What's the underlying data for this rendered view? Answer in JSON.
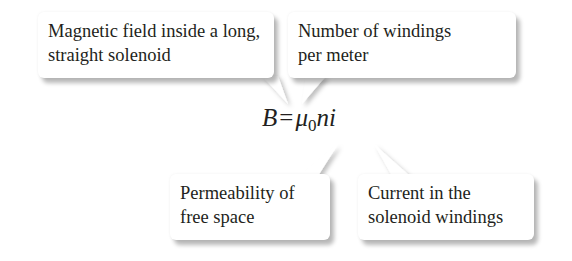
{
  "formula": {
    "lhs": "B",
    "equals": "=",
    "mu": "μ",
    "mu_subscript": "0",
    "rest": "ni"
  },
  "callouts": [
    {
      "id": "magnetic-field",
      "lines": [
        "Magnetic field inside a long,",
        "straight solenoid"
      ],
      "points_to": "B"
    },
    {
      "id": "windings-per-meter",
      "lines": [
        "Number of windings",
        "per meter"
      ],
      "points_to": "n"
    },
    {
      "id": "permeability",
      "lines": [
        "Permeability of",
        "free space"
      ],
      "points_to": "μ0"
    },
    {
      "id": "current",
      "lines": [
        "Current in the",
        "solenoid windings"
      ],
      "points_to": "i"
    }
  ]
}
